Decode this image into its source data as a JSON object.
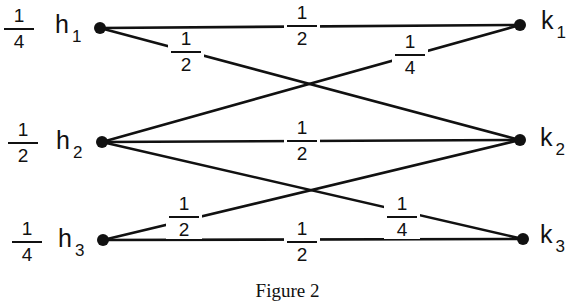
{
  "caption": "Figure 2",
  "left_nodes": [
    {
      "id": "h1",
      "letter": "h",
      "sub": "1",
      "weight_num": "1",
      "weight_den": "4",
      "x": 100,
      "y": 28
    },
    {
      "id": "h2",
      "letter": "h",
      "sub": "2",
      "weight_num": "1",
      "weight_den": "2",
      "x": 102,
      "y": 142
    },
    {
      "id": "h3",
      "letter": "h",
      "sub": "3",
      "weight_num": "1",
      "weight_den": "4",
      "x": 103,
      "y": 240
    }
  ],
  "right_nodes": [
    {
      "id": "k1",
      "letter": "k",
      "sub": "1",
      "x": 520,
      "y": 25
    },
    {
      "id": "k2",
      "letter": "k",
      "sub": "2",
      "x": 520,
      "y": 140
    },
    {
      "id": "k3",
      "letter": "k",
      "sub": "3",
      "x": 523,
      "y": 239
    }
  ],
  "edges": [
    {
      "from": "h1",
      "to": "k1",
      "num": "1",
      "den": "2"
    },
    {
      "from": "h1",
      "to": "k2",
      "num": "1",
      "den": "2"
    },
    {
      "from": "h2",
      "to": "k1",
      "num": "1",
      "den": "4"
    },
    {
      "from": "h2",
      "to": "k2",
      "num": "1",
      "den": "2"
    },
    {
      "from": "h2",
      "to": "k3",
      "num": "1",
      "den": "4"
    },
    {
      "from": "h3",
      "to": "k2",
      "num": "1",
      "den": "2"
    },
    {
      "from": "h3",
      "to": "k3",
      "num": "1",
      "den": "2"
    }
  ]
}
